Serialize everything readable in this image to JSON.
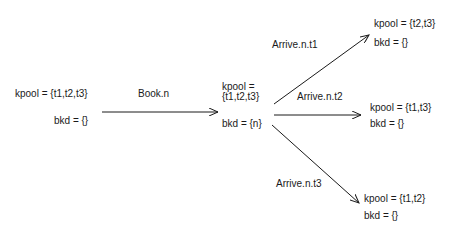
{
  "states": {
    "initial": {
      "kpool": "kpool = {t1,t2,t3}",
      "bkd": "bkd = {}"
    },
    "booked": {
      "kpool_line1": "kpool =",
      "kpool_line2": "{t1,t2,t3}",
      "bkd": "bkd = {n}"
    },
    "after_t1": {
      "kpool": "kpool = {t2,t3}",
      "bkd": "bkd = {}"
    },
    "after_t2": {
      "kpool": "kpool = {t1,t3}",
      "bkd": "bkd = {}"
    },
    "after_t3": {
      "kpool": "kpool = {t1,t2}",
      "bkd": "bkd = {}"
    }
  },
  "transitions": {
    "book": "Book.n",
    "arrive_t1": "Arrive.n.t1",
    "arrive_t2": "Arrive.n.t2",
    "arrive_t3": "Arrive.n.t3"
  }
}
